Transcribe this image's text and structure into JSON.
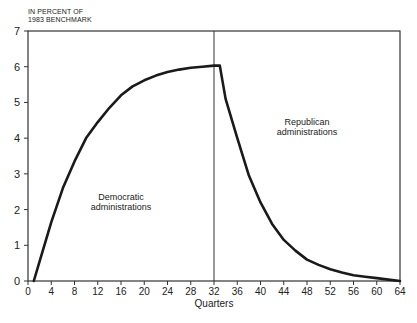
{
  "chart_data": {
    "type": "line",
    "title": "",
    "ylabel": [
      "IN PERCENT OF",
      "1983 BENCHMARK"
    ],
    "xlabel": "Quarters",
    "xlim": [
      0,
      64
    ],
    "ylim": [
      0,
      7
    ],
    "x_ticks": [
      0,
      4,
      8,
      12,
      16,
      20,
      24,
      28,
      32,
      36,
      40,
      44,
      48,
      52,
      56,
      60,
      64
    ],
    "y_ticks": [
      0,
      1,
      2,
      3,
      4,
      5,
      6,
      7
    ],
    "grid": false,
    "divider_x": 32,
    "series": [
      {
        "name": "Output effect",
        "color": "#1a1a1a",
        "x": [
          1,
          2,
          4,
          6,
          8,
          10,
          12,
          14,
          16,
          18,
          20,
          22,
          24,
          26,
          28,
          30,
          32,
          33,
          34,
          36,
          38,
          40,
          42,
          44,
          46,
          48,
          50,
          52,
          54,
          56,
          58,
          60,
          62,
          64
        ],
        "y": [
          0,
          0.55,
          1.65,
          2.6,
          3.35,
          4.0,
          4.45,
          4.85,
          5.2,
          5.45,
          5.62,
          5.75,
          5.85,
          5.92,
          5.97,
          6.0,
          6.03,
          6.03,
          5.1,
          4.0,
          2.95,
          2.2,
          1.6,
          1.15,
          0.85,
          0.6,
          0.45,
          0.33,
          0.24,
          0.16,
          0.12,
          0.08,
          0.04,
          0.0
        ]
      }
    ],
    "annotations": [
      {
        "text": [
          "Democratic",
          "administrations"
        ],
        "x": 16,
        "y": 2.2
      },
      {
        "text": [
          "Republican",
          "administrations"
        ],
        "x": 48,
        "y": 4.3
      }
    ]
  }
}
